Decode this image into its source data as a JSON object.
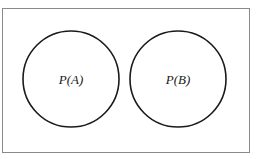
{
  "diagram": {
    "type": "venn",
    "sample_space": {
      "x": 2,
      "y": 8,
      "width": 247,
      "height": 144,
      "stroke": "#8a8a8a"
    },
    "circles": [
      {
        "id": "A",
        "label": "P(A)",
        "cx": 71,
        "cy": 79,
        "r": 48
      },
      {
        "id": "B",
        "label": "P(B)",
        "cx": 178,
        "cy": 79,
        "r": 48
      }
    ],
    "stroke_color": "#1a1a1a",
    "background": "#ffffff"
  }
}
